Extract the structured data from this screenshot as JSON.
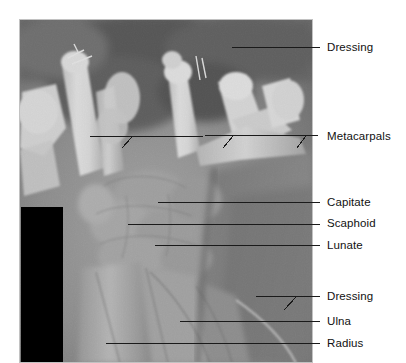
{
  "figure": {
    "type": "annotated-radiograph",
    "modality": "x-ray",
    "region": "wrist-and-hand-lateral",
    "background_color": "#ffffff",
    "image_panel": {
      "left": 19,
      "top": 19,
      "width": 294,
      "height": 344,
      "border_color": "#b8b8b8"
    },
    "masked_region": {
      "name": "black-mask-rectangle",
      "color": "#000000",
      "left": 21,
      "top": 207,
      "width": 42,
      "height": 155,
      "notch_left": 21,
      "notch_top": 228,
      "notch_width": 30,
      "notch_height": 134
    },
    "leader_line_color": "#1a1a1a",
    "leader_line_width": 1
  },
  "annotations": [
    {
      "id": "dressing-upper",
      "label": "Dressing",
      "text_x": 327,
      "text_y": 41,
      "line_x1": 232,
      "line_y1": 47,
      "line_x2": 320,
      "line_y2": 47,
      "branches": []
    },
    {
      "id": "metacarpals",
      "label": "Metacarpals",
      "text_x": 327,
      "text_y": 130,
      "line_x1": 90,
      "line_y1": 137,
      "line_x2": 320,
      "line_y2": 135,
      "branches": [
        {
          "x1": 122,
          "y1": 148,
          "x2": 132,
          "y2": 137
        },
        {
          "x1": 223,
          "y1": 148,
          "x2": 233,
          "y2": 136
        },
        {
          "x1": 297,
          "y1": 148,
          "x2": 306,
          "y2": 136
        }
      ]
    },
    {
      "id": "capitate",
      "label": "Capitate",
      "text_x": 327,
      "text_y": 196,
      "line_x1": 158,
      "line_y1": 202,
      "line_x2": 320,
      "line_y2": 202,
      "branches": []
    },
    {
      "id": "scaphoid",
      "label": "Scaphoid",
      "text_x": 327,
      "text_y": 217,
      "line_x1": 128,
      "line_y1": 224,
      "line_x2": 320,
      "line_y2": 224,
      "branches": []
    },
    {
      "id": "lunate",
      "label": "Lunate",
      "text_x": 327,
      "text_y": 239,
      "line_x1": 155,
      "line_y1": 245,
      "line_x2": 320,
      "line_y2": 245,
      "branches": []
    },
    {
      "id": "dressing-lower",
      "label": "Dressing",
      "text_x": 327,
      "text_y": 290,
      "line_x1": 256,
      "line_y1": 296,
      "line_x2": 320,
      "line_y2": 296,
      "branches": [
        {
          "x1": 284,
          "y1": 310,
          "x2": 297,
          "y2": 296
        }
      ]
    },
    {
      "id": "ulna",
      "label": "Ulna",
      "text_x": 327,
      "text_y": 315,
      "line_x1": 180,
      "line_y1": 321,
      "line_x2": 320,
      "line_y2": 321,
      "branches": []
    },
    {
      "id": "radius",
      "label": "Radius",
      "text_x": 327,
      "text_y": 337,
      "line_x1": 106,
      "line_y1": 343,
      "line_x2": 320,
      "line_y2": 343,
      "branches": []
    }
  ]
}
